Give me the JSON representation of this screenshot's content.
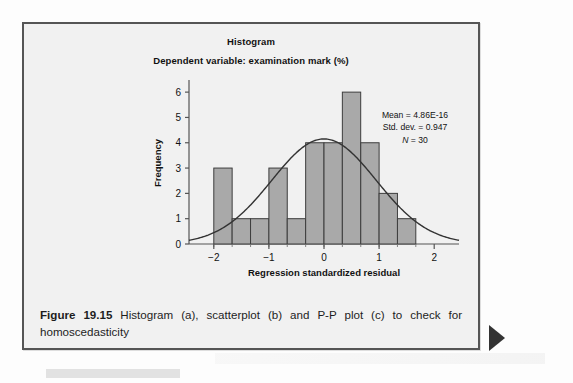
{
  "figure": {
    "caption_label": "Figure 19.15",
    "caption_text": " Histogram (a), scatterplot (b) and P-P plot (c) to check for homoscedasticity"
  },
  "chart_data": {
    "type": "bar",
    "title": "Histogram",
    "subtitle": "Dependent variable: examination mark (%)",
    "xlabel": "Regression standardized residual",
    "ylabel": "Frequency",
    "xlim": [
      -2.45,
      2.45
    ],
    "ylim": [
      0,
      6.4
    ],
    "xticks": [
      -2,
      -1,
      0,
      1,
      2
    ],
    "xtick_labels": [
      "−2",
      "−1",
      "0",
      "1",
      "2"
    ],
    "yticks": [
      0,
      1,
      2,
      3,
      4,
      5,
      6
    ],
    "ytick_labels": [
      "0",
      "1",
      "2",
      "3",
      "4",
      "5",
      "6"
    ],
    "grid": false,
    "legend": "none",
    "bin_width": 0.333,
    "bin_left_edges": [
      -2.0,
      -1.667,
      -1.333,
      -1.0,
      -0.667,
      -0.333,
      0.0,
      0.333,
      0.667,
      1.0,
      1.333
    ],
    "categories": [
      "-2.00 to -1.67",
      "-1.67 to -1.33",
      "-1.33 to -1.00",
      "-1.00 to -0.67",
      "-0.67 to -0.33",
      "-0.33 to 0.00",
      "0.00 to 0.33",
      "0.33 to 0.67",
      "0.67 to 1.00",
      "1.00 to 1.33",
      "1.33 to 1.67"
    ],
    "values": [
      3,
      1,
      1,
      3,
      1,
      4,
      4,
      6,
      4,
      2,
      1
    ],
    "bar_fill": "#a9a9a9",
    "bar_edge": "#3d3d3d",
    "curve": {
      "name": "normal-distribution-curve",
      "mean": 0.0,
      "std_dev": 0.947,
      "peak_frequency": 4.15,
      "color": "#333333"
    },
    "annotations": {
      "mean": "Mean = 4.86E-16",
      "std_dev": "Std. dev. = 0.947",
      "n_label": "N",
      "n_value": " = 30"
    }
  }
}
